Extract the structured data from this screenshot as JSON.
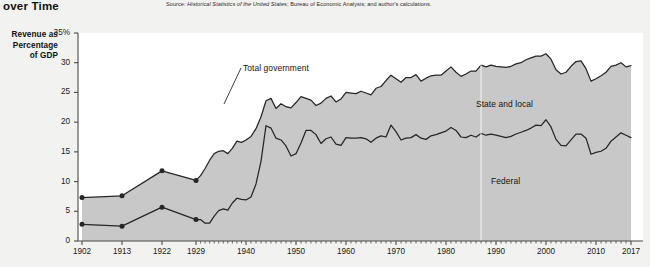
{
  "header": {
    "title_fragment": "over Time",
    "source_prefix": "Source:",
    "source_italic": "Historical Statistics of the United States",
    "source_rest": "; Bureau of Economic Analysis; and author's calculations."
  },
  "axis_label": {
    "line1": "Revenue as",
    "line2": "Percentage",
    "line3": "of GDP"
  },
  "annotations": {
    "total_government": "Total government",
    "state_and_local": "State and local",
    "federal": "Federal"
  },
  "colors": {
    "page_background": "#f2f2f0",
    "plot_background": "#ffffff",
    "area_fill": "#c8c8c8",
    "line": "#262626",
    "axis": "#4a4a4a",
    "text": "#1a1a1a"
  },
  "chart_data": {
    "type": "area",
    "title": "over Time",
    "xlabel": "",
    "ylabel": "Revenue as Percentage of GDP",
    "ylim": [
      0,
      35
    ],
    "xlim": [
      1902,
      2017
    ],
    "grid": false,
    "legend": "inline-annotations",
    "ytick_labels": [
      "35%",
      "30",
      "25",
      "20",
      "15",
      "10",
      "5",
      "0"
    ],
    "ytick_values": [
      35,
      30,
      25,
      20,
      15,
      10,
      5,
      0
    ],
    "xtick_labels": [
      "1902",
      "1913",
      "1922",
      "1929",
      "1940",
      "1950",
      "1960",
      "1970",
      "1980",
      "1990",
      "2000",
      "2010",
      "2017"
    ],
    "xtick_values": [
      1902,
      1913,
      1922,
      1929,
      1940,
      1950,
      1960,
      1970,
      1980,
      1990,
      2000,
      2010,
      2017
    ],
    "series": [
      {
        "name": "Total government",
        "kind": "upper-boundary",
        "marker_years": [
          1902,
          1913,
          1922,
          1929
        ],
        "x": [
          1902,
          1913,
          1922,
          1929,
          1930,
          1931,
          1932,
          1933,
          1934,
          1935,
          1936,
          1937,
          1938,
          1939,
          1940,
          1941,
          1942,
          1943,
          1944,
          1945,
          1946,
          1947,
          1948,
          1949,
          1950,
          1951,
          1952,
          1953,
          1954,
          1955,
          1956,
          1957,
          1958,
          1959,
          1960,
          1961,
          1962,
          1963,
          1964,
          1965,
          1966,
          1967,
          1968,
          1969,
          1970,
          1971,
          1972,
          1973,
          1974,
          1975,
          1976,
          1977,
          1978,
          1979,
          1980,
          1981,
          1982,
          1983,
          1984,
          1985,
          1986,
          1987,
          1988,
          1989,
          1990,
          1991,
          1992,
          1993,
          1994,
          1995,
          1996,
          1997,
          1998,
          1999,
          2000,
          2001,
          2002,
          2003,
          2004,
          2005,
          2006,
          2007,
          2008,
          2009,
          2010,
          2011,
          2012,
          2013,
          2014,
          2015,
          2016,
          2017
        ],
        "y": [
          7.3,
          7.6,
          11.8,
          10.2,
          11.0,
          12.2,
          13.6,
          14.7,
          15.1,
          15.2,
          14.7,
          15.6,
          16.8,
          16.6,
          17.0,
          17.6,
          18.9,
          20.9,
          23.6,
          24.0,
          22.3,
          23.1,
          22.6,
          22.4,
          23.3,
          24.3,
          24.0,
          23.7,
          22.8,
          23.2,
          24.0,
          24.4,
          23.4,
          23.9,
          25.0,
          24.9,
          24.8,
          25.2,
          24.9,
          24.6,
          25.7,
          26.0,
          27.0,
          27.9,
          27.3,
          26.7,
          27.5,
          27.5,
          28.0,
          26.9,
          27.4,
          27.8,
          27.9,
          27.9,
          28.6,
          29.3,
          28.4,
          27.7,
          28.1,
          28.6,
          28.6,
          29.6,
          29.3,
          29.6,
          29.4,
          29.3,
          29.2,
          29.4,
          29.8,
          30.0,
          30.5,
          30.8,
          31.1,
          31.1,
          31.5,
          30.6,
          28.8,
          28.1,
          28.4,
          29.4,
          30.2,
          30.3,
          29.0,
          26.9,
          27.3,
          27.8,
          28.4,
          29.4,
          29.6,
          30.0,
          29.3,
          29.5
        ]
      },
      {
        "name": "Federal",
        "kind": "lower-boundary",
        "marker_years": [
          1902,
          1913,
          1922,
          1929
        ],
        "x": [
          1902,
          1913,
          1922,
          1929,
          1930,
          1931,
          1932,
          1933,
          1934,
          1935,
          1936,
          1937,
          1938,
          1939,
          1940,
          1941,
          1942,
          1943,
          1944,
          1945,
          1946,
          1947,
          1948,
          1949,
          1950,
          1951,
          1952,
          1953,
          1954,
          1955,
          1956,
          1957,
          1958,
          1959,
          1960,
          1961,
          1962,
          1963,
          1964,
          1965,
          1966,
          1967,
          1968,
          1969,
          1970,
          1971,
          1972,
          1973,
          1974,
          1975,
          1976,
          1977,
          1978,
          1979,
          1980,
          1981,
          1982,
          1983,
          1984,
          1985,
          1986,
          1987,
          1988,
          1989,
          1990,
          1991,
          1992,
          1993,
          1994,
          1995,
          1996,
          1997,
          1998,
          1999,
          2000,
          2001,
          2002,
          2003,
          2004,
          2005,
          2006,
          2007,
          2008,
          2009,
          2010,
          2011,
          2012,
          2013,
          2014,
          2015,
          2016,
          2017
        ],
        "y": [
          2.8,
          2.5,
          5.7,
          3.6,
          3.6,
          3.0,
          3.0,
          4.2,
          5.1,
          5.4,
          5.2,
          6.4,
          7.2,
          7.0,
          6.9,
          7.4,
          9.6,
          13.4,
          19.4,
          19.0,
          17.3,
          17.0,
          16.0,
          14.3,
          14.7,
          16.5,
          18.6,
          18.6,
          17.9,
          16.4,
          17.2,
          17.5,
          16.3,
          16.1,
          17.4,
          17.3,
          17.3,
          17.4,
          17.2,
          16.6,
          17.3,
          17.7,
          17.5,
          19.5,
          18.4,
          17.0,
          17.3,
          17.4,
          17.9,
          17.3,
          17.1,
          17.7,
          17.9,
          18.2,
          18.5,
          19.1,
          18.6,
          17.5,
          17.4,
          17.8,
          17.5,
          18.1,
          17.8,
          18.0,
          17.8,
          17.6,
          17.4,
          17.6,
          18.0,
          18.3,
          18.6,
          19.0,
          19.5,
          19.4,
          20.4,
          19.2,
          17.1,
          16.1,
          16.0,
          17.0,
          18.0,
          18.0,
          17.3,
          14.6,
          14.9,
          15.1,
          15.6,
          16.8,
          17.5,
          18.2,
          17.8,
          17.4
        ]
      }
    ]
  }
}
